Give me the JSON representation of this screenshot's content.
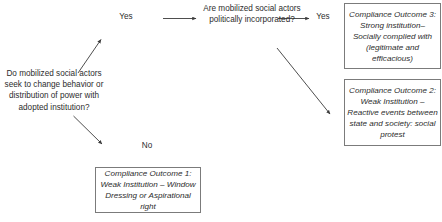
{
  "diagram": {
    "type": "flowchart",
    "background_color": "#ffffff",
    "line_color": "#3a3a3a",
    "box_border_color": "#7b7b7b",
    "text_color": "#2d2d2d"
  },
  "nodes": {
    "start_question": "Do mobilized social actors seek to change behavior or distribution of power with adopted institution?",
    "incorporation_question": "Are mobilized social actors politically incorporated?"
  },
  "edge_labels": {
    "start_yes": "Yes",
    "start_no": "No",
    "incorporation_yes": "Yes",
    "incorporation_no": "No"
  },
  "outcomes": {
    "outcome3": "Compliance Outcome 3: Strong institution–Socially complied with (legitimate and efficacious)",
    "outcome2": "Compliance Outcome 2: Weak Institution – Reactive events between state and society: social protest",
    "outcome1": "Compliance Outcome 1: Weak Institution – Window Dressing or Aspirational right"
  }
}
